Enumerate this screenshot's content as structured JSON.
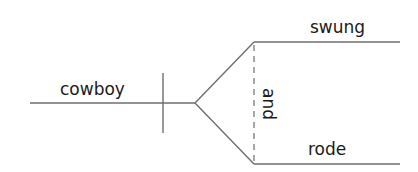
{
  "diagram": {
    "type": "sentence-diagram",
    "subject": "cowboy",
    "conjunction": "and",
    "predicates": [
      "swung",
      "rode"
    ],
    "colors": {
      "line": "#6e6e6e",
      "text": "#1a1a1a",
      "background": "#ffffff"
    }
  }
}
